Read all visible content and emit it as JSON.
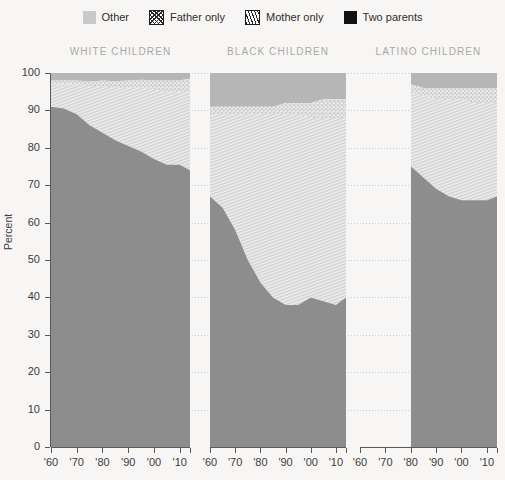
{
  "legend": {
    "items": [
      {
        "label": "Other",
        "icon": "solid-gray-swatch",
        "key": "other"
      },
      {
        "label": "Father only",
        "icon": "crosshatch-swatch",
        "key": "father"
      },
      {
        "label": "Mother only",
        "icon": "diagonal-hatch-swatch",
        "key": "mother"
      },
      {
        "label": "Two parents",
        "icon": "solid-black-swatch",
        "key": "two"
      }
    ]
  },
  "axis": {
    "ylabel": "Percent",
    "yticks": [
      0,
      10,
      20,
      30,
      40,
      50,
      60,
      70,
      80,
      90,
      100
    ],
    "xticks": [
      "'60",
      "'70",
      "'80",
      "'90",
      "'00",
      "'10"
    ]
  },
  "colors": {
    "background": "#f7f6f4",
    "two_parents": "#8d8d8d",
    "other": "#b6b6b6",
    "hatch_ink": "#cfcfcf",
    "hatch_bg": "#efefef",
    "grid": "#b9c8d8",
    "title": "#a9a9a9",
    "text": "#3c3c3c"
  },
  "chart_data": {
    "type": "area",
    "title": "",
    "subtitle": "",
    "xlabel": "",
    "ylabel": "Percent",
    "ylim": [
      0,
      100
    ],
    "grid": true,
    "legend_position": "top-center",
    "stack_order_bottom_to_top": [
      "Two parents",
      "Mother only",
      "Father only",
      "Other"
    ],
    "panels": [
      {
        "name": "WHITE CHILDREN",
        "x_start": 1960,
        "x_end": 2014,
        "x": [
          1960,
          1965,
          1970,
          1975,
          1980,
          1985,
          1990,
          1995,
          2000,
          2005,
          2010,
          2014
        ],
        "series": [
          {
            "name": "Two parents",
            "values": [
              91,
              90.5,
              89,
              86,
              84,
              82,
              80.5,
              79,
              77,
              75.5,
              75.5,
              74
            ]
          },
          {
            "name": "Mother only",
            "values": [
              6,
              6.5,
              8,
              10.5,
              12.5,
              14,
              15.5,
              17,
              18.5,
              19.5,
              19.5,
              21
            ]
          },
          {
            "name": "Father only",
            "values": [
              1,
              1,
              1,
              1.2,
              1.5,
              1.8,
              2,
              2.2,
              2.5,
              3,
              3,
              3.5
            ]
          },
          {
            "name": "Other",
            "values": [
              2,
              2,
              2,
              2.3,
              2,
              2.2,
              2,
              1.8,
              2,
              2,
              2,
              1.5
            ]
          }
        ]
      },
      {
        "name": "BLACK CHILDREN",
        "x_start": 1960,
        "x_end": 2014,
        "x": [
          1960,
          1965,
          1970,
          1975,
          1980,
          1985,
          1990,
          1995,
          2000,
          2005,
          2010,
          2014
        ],
        "series": [
          {
            "name": "Two parents",
            "values": [
              67,
              64,
              58,
              50,
              44,
              40,
              38,
              38,
              40,
              39,
              38,
              40
            ]
          },
          {
            "name": "Mother only",
            "values": [
              22,
              25,
              31,
              39,
              45,
              49,
              51,
              51,
              48,
              49,
              50,
              48
            ]
          },
          {
            "name": "Father only",
            "values": [
              2,
              2,
              2,
              2,
              2,
              2,
              3,
              3,
              4,
              5,
              5,
              5
            ]
          },
          {
            "name": "Other",
            "values": [
              9,
              9,
              9,
              9,
              9,
              9,
              8,
              8,
              8,
              7,
              7,
              7
            ]
          }
        ]
      },
      {
        "name": "LATINO CHILDREN",
        "x_start": 1980,
        "x_end": 2014,
        "x": [
          1980,
          1985,
          1990,
          1995,
          2000,
          2005,
          2010,
          2014
        ],
        "series": [
          {
            "name": "Two parents",
            "values": [
              75,
              72,
              69,
              67,
              66,
              66,
              66,
              67
            ]
          },
          {
            "name": "Mother only",
            "values": [
              20,
              22,
              24,
              26,
              27,
              26,
              26,
              25
            ]
          },
          {
            "name": "Father only",
            "values": [
              2,
              2,
              3,
              3,
              3,
              4,
              4,
              4
            ]
          },
          {
            "name": "Other",
            "values": [
              3,
              4,
              4,
              4,
              4,
              4,
              4,
              4
            ]
          }
        ]
      }
    ]
  }
}
